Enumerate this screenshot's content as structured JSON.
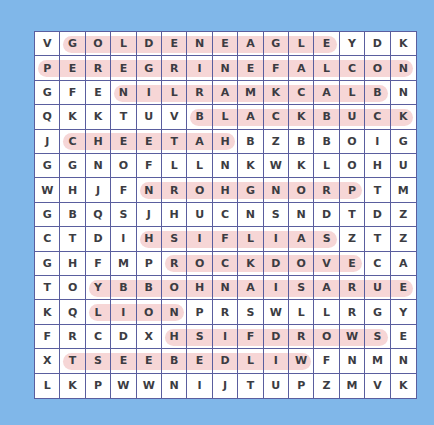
{
  "puzzle": {
    "rows": [
      [
        "V",
        "G",
        "O",
        "L",
        "D",
        "E",
        "N",
        "E",
        "A",
        "G",
        "L",
        "E",
        "Y",
        "D",
        "K"
      ],
      [
        "P",
        "E",
        "R",
        "E",
        "G",
        "R",
        "I",
        "N",
        "E",
        "F",
        "A",
        "L",
        "C",
        "O",
        "N"
      ],
      [
        "G",
        "F",
        "E",
        "N",
        "I",
        "L",
        "R",
        "A",
        "M",
        "K",
        "C",
        "A",
        "L",
        "B",
        "N"
      ],
      [
        "Q",
        "K",
        "K",
        "T",
        "U",
        "V",
        "B",
        "L",
        "A",
        "C",
        "K",
        "B",
        "U",
        "C",
        "K"
      ],
      [
        "J",
        "C",
        "H",
        "E",
        "E",
        "T",
        "A",
        "H",
        "B",
        "Z",
        "B",
        "B",
        "O",
        "I",
        "G"
      ],
      [
        "G",
        "G",
        "N",
        "O",
        "F",
        "L",
        "L",
        "N",
        "K",
        "W",
        "K",
        "L",
        "O",
        "H",
        "U"
      ],
      [
        "W",
        "H",
        "J",
        "F",
        "N",
        "R",
        "O",
        "H",
        "G",
        "N",
        "O",
        "R",
        "P",
        "T",
        "M"
      ],
      [
        "G",
        "B",
        "Q",
        "S",
        "J",
        "H",
        "U",
        "C",
        "N",
        "S",
        "N",
        "D",
        "T",
        "D",
        "Z"
      ],
      [
        "C",
        "T",
        "D",
        "I",
        "H",
        "S",
        "I",
        "F",
        "L",
        "I",
        "A",
        "S",
        "Z",
        "T",
        "Z"
      ],
      [
        "G",
        "H",
        "F",
        "M",
        "P",
        "R",
        "O",
        "C",
        "K",
        "D",
        "O",
        "V",
        "E",
        "C",
        "A"
      ],
      [
        "T",
        "O",
        "Y",
        "B",
        "B",
        "O",
        "H",
        "N",
        "A",
        "I",
        "S",
        "A",
        "R",
        "U",
        "E"
      ],
      [
        "K",
        "Q",
        "L",
        "I",
        "O",
        "N",
        "P",
        "R",
        "S",
        "W",
        "L",
        "L",
        "R",
        "G",
        "Y"
      ],
      [
        "F",
        "R",
        "C",
        "D",
        "X",
        "H",
        "S",
        "I",
        "F",
        "D",
        "R",
        "O",
        "W",
        "S",
        "E"
      ],
      [
        "X",
        "T",
        "S",
        "E",
        "E",
        "B",
        "E",
        "D",
        "L",
        "I",
        "W",
        "F",
        "N",
        "M",
        "N"
      ],
      [
        "L",
        "K",
        "P",
        "W",
        "W",
        "N",
        "I",
        "J",
        "T",
        "U",
        "P",
        "Z",
        "M",
        "V",
        "K"
      ]
    ],
    "found_words": [
      {
        "word": "GOLDEN EAGLE",
        "row": 0,
        "start_col": 1,
        "end_col": 11
      },
      {
        "word": "PEREGRINE FALCON",
        "row": 1,
        "start_col": 0,
        "end_col": 14
      },
      {
        "word": "BLACK MARLIN",
        "row": 2,
        "start_col": 3,
        "end_col": 13
      },
      {
        "word": "BLACKBUCK",
        "row": 3,
        "start_col": 6,
        "end_col": 14
      },
      {
        "word": "CHEETAH",
        "row": 4,
        "start_col": 1,
        "end_col": 7
      },
      {
        "word": "PRONGHORN",
        "row": 6,
        "start_col": 4,
        "end_col": 12
      },
      {
        "word": "SAILFISH",
        "row": 8,
        "start_col": 4,
        "end_col": 11
      },
      {
        "word": "ROCK DOVE",
        "row": 9,
        "start_col": 5,
        "end_col": 12
      },
      {
        "word": "EURASIAN HOBBY",
        "row": 10,
        "start_col": 2,
        "end_col": 14
      },
      {
        "word": "LION",
        "row": 11,
        "start_col": 2,
        "end_col": 5
      },
      {
        "word": "SWORDFISH",
        "row": 12,
        "start_col": 5,
        "end_col": 13
      },
      {
        "word": "WILDEBEEST",
        "row": 13,
        "start_col": 1,
        "end_col": 10
      }
    ],
    "colors": {
      "background": "#80b7e9",
      "grid_line": "#5a5e9e",
      "highlight": "#f6d6d6",
      "letter": "#3c3c42"
    }
  }
}
